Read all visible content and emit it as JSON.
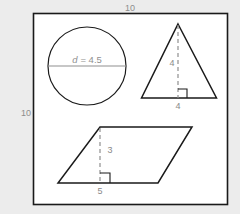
{
  "figure": {
    "frame": {
      "name": "bounding-square",
      "top_dimension_label": "10",
      "left_dimension_label": "10",
      "units": "",
      "stroke_color": "#1a1a1a",
      "fill_color": "#ffffff"
    },
    "background_color": "#ececec",
    "label_color": "#8c8c8c",
    "shapes": [
      {
        "id": "circle",
        "type": "circle",
        "name": "circle-shape",
        "diameter_label": "d = 4.5",
        "diameter_symbol": "d",
        "diameter_equals": "= 4.5",
        "diameter_value": 4.5,
        "stroke_color": "#1a1a1a"
      },
      {
        "id": "triangle",
        "type": "triangle",
        "name": "triangle-shape",
        "height_label": "4",
        "base_label": "4",
        "height_value": 4,
        "base_value": 4,
        "has_right_angle_marker": true,
        "stroke_color": "#1a1a1a"
      },
      {
        "id": "parallelogram",
        "type": "parallelogram",
        "name": "parallelogram-shape",
        "height_label": "3",
        "base_label": "5",
        "height_value": 3,
        "base_value": 5,
        "has_right_angle_marker": true,
        "stroke_color": "#1a1a1a"
      }
    ]
  }
}
